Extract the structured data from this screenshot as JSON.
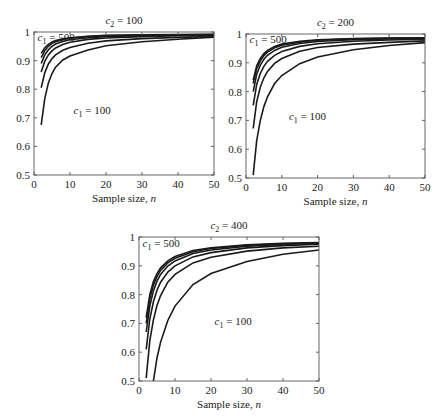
{
  "chart_data": [
    {
      "type": "line",
      "title": "c2 = 100",
      "title_parts": {
        "var": "c",
        "sub": "2",
        "rest": " = 100"
      },
      "xlabel": "Sample size, n",
      "xlabel_parts": {
        "text": "Sample size, ",
        "var": "n"
      },
      "ylabel": "",
      "xlim": [
        0,
        50
      ],
      "ylim": [
        0.5,
        1
      ],
      "xticks": [
        0,
        10,
        20,
        30,
        40,
        50
      ],
      "yticks": [
        0.5,
        0.6,
        0.7,
        0.8,
        0.9,
        1
      ],
      "ytick_labels": [
        "0.5",
        "0.6",
        "0.7",
        "0.8",
        "0.9",
        "1"
      ],
      "grid": false,
      "annotations": [
        {
          "text": "c1 = 500",
          "var": "c",
          "sub": "1",
          "rest": " = 500",
          "x": 1,
          "y": 0.97
        },
        {
          "text": "c1 = 100",
          "var": "c",
          "sub": "1",
          "rest": " = 100",
          "x": 11,
          "y": 0.715
        }
      ],
      "x": [
        2,
        3,
        4,
        5,
        6,
        8,
        10,
        15,
        20,
        30,
        40,
        50
      ],
      "series": [
        {
          "name": "c1 = 500",
          "values": [
            0.925,
            0.945,
            0.957,
            0.965,
            0.97,
            0.976,
            0.98,
            0.985,
            0.988,
            0.99,
            0.991,
            0.992
          ]
        },
        {
          "name": "c1 = 400",
          "values": [
            0.91,
            0.935,
            0.95,
            0.96,
            0.966,
            0.973,
            0.978,
            0.984,
            0.987,
            0.989,
            0.99,
            0.991
          ]
        },
        {
          "name": "c1 = 300",
          "values": [
            0.89,
            0.92,
            0.938,
            0.95,
            0.958,
            0.967,
            0.973,
            0.98,
            0.984,
            0.987,
            0.989,
            0.99
          ]
        },
        {
          "name": "c1 = 200",
          "values": [
            0.86,
            0.898,
            0.92,
            0.934,
            0.944,
            0.956,
            0.964,
            0.974,
            0.979,
            0.984,
            0.987,
            0.988
          ]
        },
        {
          "name": "c1 = 150",
          "values": [
            0.805,
            0.858,
            0.888,
            0.907,
            0.92,
            0.936,
            0.946,
            0.961,
            0.969,
            0.977,
            0.981,
            0.984
          ]
        },
        {
          "name": "c1 = 100",
          "values": [
            0.675,
            0.768,
            0.822,
            0.855,
            0.877,
            0.902,
            0.916,
            0.937,
            0.952,
            0.966,
            0.975,
            0.982
          ]
        }
      ]
    },
    {
      "type": "line",
      "title": "c2 = 200",
      "title_parts": {
        "var": "c",
        "sub": "2",
        "rest": " = 200"
      },
      "xlabel": "Sample size, n",
      "xlabel_parts": {
        "text": "Sample size, ",
        "var": "n"
      },
      "ylabel": "",
      "xlim": [
        0,
        50
      ],
      "ylim": [
        0.5,
        1
      ],
      "xticks": [
        0,
        10,
        20,
        30,
        40,
        50
      ],
      "yticks": [
        0.5,
        0.6,
        0.7,
        0.8,
        0.9,
        1
      ],
      "ytick_labels": [
        "0.5",
        "0.6",
        "0.7",
        "0.8",
        "0.9",
        "1"
      ],
      "grid": false,
      "annotations": [
        {
          "text": "c1 = 500",
          "var": "c",
          "sub": "1",
          "rest": " = 500",
          "x": 1,
          "y": 0.97
        },
        {
          "text": "c1 = 100",
          "var": "c",
          "sub": "1",
          "rest": " = 100",
          "x": 12,
          "y": 0.7
        }
      ],
      "x": [
        2,
        3,
        4,
        5,
        6,
        8,
        10,
        15,
        20,
        30,
        40,
        50
      ],
      "series": [
        {
          "name": "c1 = 500",
          "values": [
            0.84,
            0.89,
            0.915,
            0.932,
            0.943,
            0.957,
            0.965,
            0.975,
            0.98,
            0.984,
            0.986,
            0.987
          ]
        },
        {
          "name": "c1 = 400",
          "values": [
            0.828,
            0.88,
            0.907,
            0.925,
            0.937,
            0.952,
            0.961,
            0.972,
            0.978,
            0.983,
            0.985,
            0.986
          ]
        },
        {
          "name": "c1 = 300",
          "values": [
            0.8,
            0.86,
            0.892,
            0.912,
            0.926,
            0.943,
            0.954,
            0.967,
            0.974,
            0.98,
            0.983,
            0.985
          ]
        },
        {
          "name": "c1 = 200",
          "values": [
            0.752,
            0.825,
            0.863,
            0.888,
            0.905,
            0.926,
            0.939,
            0.957,
            0.966,
            0.975,
            0.979,
            0.982
          ]
        },
        {
          "name": "c1 = 150",
          "values": [
            0.672,
            0.765,
            0.815,
            0.848,
            0.87,
            0.898,
            0.915,
            0.94,
            0.953,
            0.965,
            0.971,
            0.976
          ]
        },
        {
          "name": "c1 = 100",
          "values": [
            0.51,
            0.63,
            0.7,
            0.748,
            0.782,
            0.828,
            0.856,
            0.897,
            0.92,
            0.945,
            0.96,
            0.97
          ]
        }
      ]
    },
    {
      "type": "line",
      "title": "c2 = 400",
      "title_parts": {
        "var": "c",
        "sub": "2",
        "rest": " = 400"
      },
      "xlabel": "Sample size, n",
      "xlabel_parts": {
        "text": "Sample size, ",
        "var": "n"
      },
      "ylabel": "",
      "xlim": [
        0,
        50
      ],
      "ylim": [
        0.5,
        1
      ],
      "xticks": [
        0,
        10,
        20,
        30,
        40,
        50
      ],
      "yticks": [
        0.5,
        0.6,
        0.7,
        0.8,
        0.9,
        1
      ],
      "ytick_labels": [
        "0.5",
        "0.6",
        "0.7",
        "0.8",
        "0.9",
        "1"
      ],
      "grid": false,
      "annotations": [
        {
          "text": "c1 = 500",
          "var": "c",
          "sub": "1",
          "rest": " = 500",
          "x": 1,
          "y": 0.965
        },
        {
          "text": "c1 = 100",
          "var": "c",
          "sub": "1",
          "rest": " = 100",
          "x": 21,
          "y": 0.695
        }
      ],
      "x": [
        2,
        3,
        4,
        5,
        6,
        8,
        10,
        15,
        20,
        30,
        40,
        50
      ],
      "series": [
        {
          "name": "c1 = 500",
          "values": [
            0.72,
            0.8,
            0.845,
            0.873,
            0.893,
            0.917,
            0.932,
            0.953,
            0.963,
            0.973,
            0.978,
            0.981
          ]
        },
        {
          "name": "c1 = 400",
          "values": [
            0.7,
            0.785,
            0.833,
            0.863,
            0.884,
            0.91,
            0.926,
            0.949,
            0.96,
            0.971,
            0.976,
            0.98
          ]
        },
        {
          "name": "c1 = 300",
          "values": [
            0.67,
            0.76,
            0.813,
            0.847,
            0.87,
            0.899,
            0.917,
            0.943,
            0.955,
            0.968,
            0.974,
            0.978
          ]
        },
        {
          "name": "c1 = 200",
          "values": [
            0.61,
            0.715,
            0.775,
            0.815,
            0.843,
            0.878,
            0.9,
            0.931,
            0.946,
            0.962,
            0.97,
            0.975
          ]
        },
        {
          "name": "c1 = 150",
          "values": [
            0.51,
            0.64,
            0.712,
            0.762,
            0.797,
            0.843,
            0.87,
            0.91,
            0.93,
            0.951,
            0.962,
            0.968
          ]
        },
        {
          "name": "c1 = 100",
          "values": [
            null,
            null,
            0.5,
            0.58,
            0.635,
            0.71,
            0.76,
            0.835,
            0.873,
            0.915,
            0.94,
            0.955
          ]
        }
      ]
    }
  ]
}
